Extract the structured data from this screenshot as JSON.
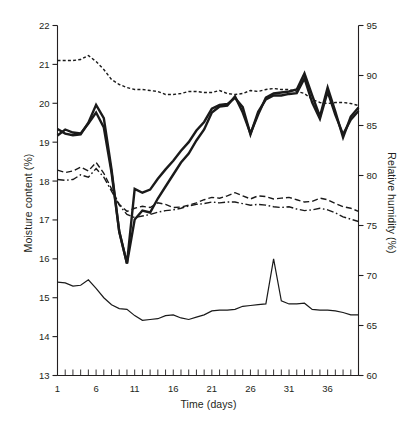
{
  "chart_data": {
    "type": "line",
    "title": "",
    "xlabel": "Time (days)",
    "ylabel": "Moisture content (%)",
    "y2label": "Relative humidity (%)",
    "xlim": [
      1,
      40
    ],
    "ylim": [
      13,
      22
    ],
    "y2lim": [
      60,
      95
    ],
    "grid": false,
    "legend": "none",
    "x_ticks_major": [
      1,
      6,
      11,
      16,
      21,
      26,
      31,
      36
    ],
    "x_tick_labels": [
      "1",
      "6",
      "11",
      "16",
      "21",
      "26",
      "31",
      "36"
    ],
    "x_ticks_minor_step": 1,
    "y_ticks": [
      13,
      14,
      15,
      16,
      17,
      18,
      19,
      20,
      21,
      22
    ],
    "y_tick_labels": [
      "13",
      "14",
      "15",
      "16",
      "17",
      "18",
      "19",
      "20",
      "21",
      "22"
    ],
    "y2_ticks": [
      60,
      65,
      70,
      75,
      80,
      85,
      90,
      95
    ],
    "y2_tick_labels": [
      "60",
      "65",
      "70",
      "75",
      "80",
      "85",
      "90",
      "95"
    ],
    "x": [
      1,
      2,
      3,
      4,
      5,
      6,
      7,
      8,
      9,
      10,
      11,
      12,
      13,
      14,
      15,
      16,
      17,
      18,
      19,
      20,
      21,
      22,
      23,
      24,
      25,
      26,
      27,
      28,
      29,
      30,
      31,
      32,
      33,
      34,
      35,
      36,
      37,
      38,
      39,
      40
    ],
    "series": [
      {
        "name": "relative-humidity-upper",
        "axis": "right",
        "style": "dotted",
        "width": 1.4,
        "color": "#1a1a1a",
        "values": [
          91.5,
          91.5,
          91.5,
          91.6,
          92.0,
          91.4,
          90.6,
          89.6,
          89.1,
          88.8,
          88.6,
          88.6,
          88.5,
          88.4,
          88.1,
          88.1,
          88.2,
          88.4,
          88.4,
          88.3,
          88.3,
          88.5,
          88.2,
          88.1,
          88.2,
          88.5,
          88.4,
          88.6,
          88.7,
          88.6,
          88.6,
          88.4,
          88.2,
          87.6,
          87.3,
          87.2,
          87.3,
          87.3,
          87.2,
          87.0
        ]
      },
      {
        "name": "relative-humidity-main",
        "axis": "right",
        "style": "solid",
        "width": 2.4,
        "color": "#1a1a1a",
        "values": [
          84.0,
          84.6,
          84.3,
          84.2,
          85.2,
          86.3,
          84.8,
          80.3,
          74.4,
          71.2,
          75.6,
          76.5,
          76.3,
          77.7,
          78.9,
          80.1,
          81.3,
          82.2,
          83.5,
          84.6,
          86.3,
          86.9,
          87.0,
          87.9,
          86.3,
          84.2,
          86.1,
          87.8,
          88.2,
          88.3,
          88.4,
          88.6,
          90.2,
          88.0,
          85.9,
          88.8,
          86.4,
          83.8,
          85.9,
          86.8
        ]
      },
      {
        "name": "moisture-content-upper-dashed",
        "axis": "left",
        "style": "dashed",
        "width": 1.4,
        "color": "#1a1a1a",
        "values": [
          18.28,
          18.22,
          18.26,
          18.36,
          18.26,
          18.48,
          18.2,
          17.8,
          17.4,
          17.22,
          17.3,
          17.35,
          17.32,
          17.44,
          17.4,
          17.32,
          17.33,
          17.38,
          17.44,
          17.52,
          17.58,
          17.56,
          17.62,
          17.7,
          17.62,
          17.54,
          17.62,
          17.6,
          17.54,
          17.56,
          17.58,
          17.52,
          17.46,
          17.48,
          17.56,
          17.52,
          17.42,
          17.34,
          17.3,
          17.22
        ]
      },
      {
        "name": "moisture-content-lower-dashdot",
        "axis": "left",
        "style": "dashdot",
        "width": 1.4,
        "color": "#1a1a1a",
        "values": [
          18.04,
          18.02,
          18.04,
          18.16,
          18.1,
          18.32,
          18.1,
          17.74,
          17.38,
          17.14,
          17.06,
          17.1,
          17.14,
          17.2,
          17.24,
          17.26,
          17.3,
          17.36,
          17.4,
          17.42,
          17.46,
          17.44,
          17.46,
          17.46,
          17.42,
          17.38,
          17.4,
          17.38,
          17.34,
          17.32,
          17.34,
          17.28,
          17.24,
          17.26,
          17.3,
          17.26,
          17.18,
          17.08,
          17.02,
          16.96
        ]
      },
      {
        "name": "moisture-content-main",
        "axis": "left",
        "style": "solid",
        "width": 2.4,
        "color": "#1a1a1a",
        "values": [
          19.34,
          19.22,
          19.18,
          19.2,
          19.5,
          19.96,
          19.62,
          18.3,
          16.7,
          15.88,
          17.8,
          17.7,
          17.78,
          18.06,
          18.3,
          18.52,
          18.78,
          19.0,
          19.3,
          19.52,
          19.86,
          19.96,
          19.98,
          20.14,
          19.9,
          19.2,
          19.78,
          20.1,
          20.2,
          20.2,
          20.24,
          20.26,
          20.64,
          20.02,
          19.6,
          20.3,
          19.7,
          19.2,
          19.58,
          19.8
        ]
      },
      {
        "name": "moisture-content-bottom",
        "axis": "left",
        "style": "solid",
        "width": 1.2,
        "color": "#1a1a1a",
        "values": [
          15.4,
          15.38,
          15.3,
          15.32,
          15.46,
          15.24,
          15.0,
          14.82,
          14.72,
          14.7,
          14.54,
          14.42,
          14.44,
          14.46,
          14.54,
          14.56,
          14.48,
          14.44,
          14.5,
          14.56,
          14.66,
          14.68,
          14.68,
          14.7,
          14.78,
          14.8,
          14.82,
          14.84,
          16.0,
          14.92,
          14.84,
          14.84,
          14.86,
          14.7,
          14.68,
          14.68,
          14.66,
          14.62,
          14.56,
          14.56
        ]
      }
    ]
  }
}
